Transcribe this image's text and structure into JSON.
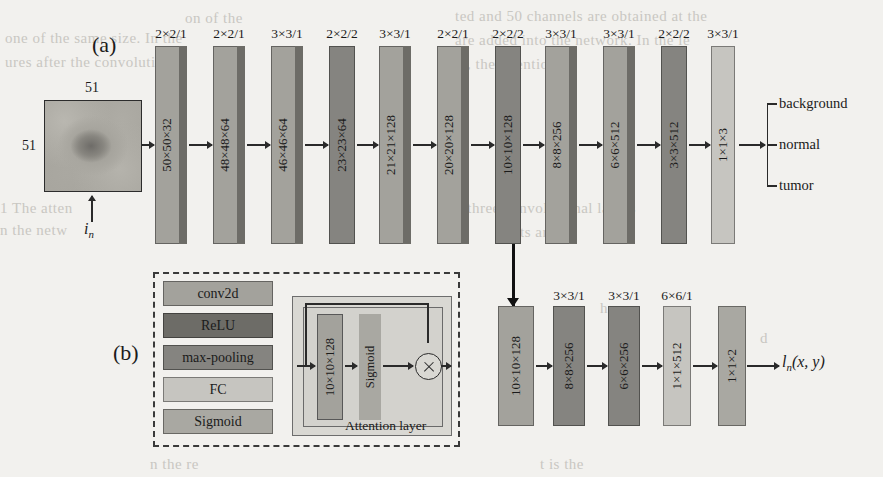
{
  "figure": {
    "panel_a_letter": "(a)",
    "panel_b_letter": "(b)",
    "input": {
      "width_label": "51",
      "height_label": "51",
      "input_symbol": "i",
      "input_symbol_sub": "n"
    },
    "output_formula_main": "l",
    "output_formula_sub": "n",
    "output_formula_tail": "(x, y)"
  },
  "colors": {
    "conv2d": "#a3a29c",
    "relu": "#6d6c67",
    "max_pooling": "#858480",
    "fc": "#c6c5c0",
    "sigmoid": "#a9a8a2",
    "page_background": "#f2f1ee",
    "line": "#2a2a2a",
    "attention_panel": "#d9d8d3"
  },
  "top_branch": {
    "layers": [
      {
        "name": "conv1",
        "kernel": "2×2/1",
        "shape": "50×50×32",
        "type": "conv2d",
        "x": 155,
        "w": 32,
        "edge": 8
      },
      {
        "name": "conv2",
        "kernel": "2×2/1",
        "shape": "48×48×64",
        "type": "conv2d",
        "x": 213,
        "w": 32,
        "edge": 8
      },
      {
        "name": "conv3",
        "kernel": "3×3/1",
        "shape": "46×46×64",
        "type": "conv2d",
        "x": 271,
        "w": 32,
        "edge": 8
      },
      {
        "name": "pool1",
        "kernel": "2×2/2",
        "shape": "23×23×64",
        "type": "max-pooling",
        "x": 329,
        "w": 26,
        "edge": 0
      },
      {
        "name": "conv4",
        "kernel": "3×3/1",
        "shape": "21×21×128",
        "type": "conv2d",
        "x": 379,
        "w": 32,
        "edge": 8
      },
      {
        "name": "conv5",
        "kernel": "2×2/1",
        "shape": "20×20×128",
        "type": "conv2d",
        "x": 437,
        "w": 32,
        "edge": 8
      },
      {
        "name": "pool2",
        "kernel": "2×2/2",
        "shape": "10×10×128",
        "type": "max-pooling",
        "x": 495,
        "w": 26,
        "edge": 0
      },
      {
        "name": "conv6",
        "kernel": "3×3/1",
        "shape": "8×8×256",
        "type": "conv2d",
        "x": 545,
        "w": 32,
        "edge": 8
      },
      {
        "name": "conv7",
        "kernel": "3×3/1",
        "shape": "6×6×512",
        "type": "conv2d",
        "x": 603,
        "w": 32,
        "edge": 8
      },
      {
        "name": "pool3",
        "kernel": "2×2/2",
        "shape": "3×3×512",
        "type": "max-pooling",
        "x": 661,
        "w": 26,
        "edge": 0
      },
      {
        "name": "fc1",
        "kernel": "3×3/1",
        "shape": "1×1×3",
        "type": "fc",
        "x": 711,
        "w": 24,
        "edge": 0
      }
    ],
    "classes": [
      "background",
      "normal",
      "tumor"
    ]
  },
  "bottom_branch": {
    "layers": [
      {
        "name": "feat",
        "kernel": "",
        "shape": "10×10×128",
        "type": "conv2d",
        "x": 498,
        "w": 36,
        "edge": 0
      },
      {
        "name": "conv8",
        "kernel": "3×3/1",
        "shape": "8×8×256",
        "type": "max-pooling",
        "x": 553,
        "w": 32,
        "edge": 0
      },
      {
        "name": "conv9",
        "kernel": "3×3/1",
        "shape": "6×6×256",
        "type": "max-pooling",
        "x": 608,
        "w": 32,
        "edge": 0
      },
      {
        "name": "fc2",
        "kernel": "6×6/1",
        "shape": "1×1×512",
        "type": "fc",
        "x": 663,
        "w": 28,
        "edge": 0
      },
      {
        "name": "fc3",
        "kernel": "",
        "shape": "1×1×2",
        "type": "sigmoid",
        "x": 718,
        "w": 28,
        "edge": 0
      }
    ]
  },
  "legend": {
    "items": [
      {
        "label": "conv2d",
        "type": "conv2d"
      },
      {
        "label": "ReLU",
        "type": "relu"
      },
      {
        "label": "max-pooling",
        "type": "max-pooling"
      },
      {
        "label": "FC",
        "type": "fc"
      },
      {
        "label": "Sigmoid",
        "type": "sigmoid"
      }
    ]
  },
  "attention": {
    "caption": "Attention layer",
    "conv_label": "10×10×128",
    "sigmoid_label": "Sigmoid",
    "multiply_symbol": "⊗"
  },
  "ghost_text": [
    {
      "t": "ted and 50 channels are obtained at the",
      "x": 455,
      "y": 8
    },
    {
      "t": "on of the",
      "x": 185,
      "y": 10
    },
    {
      "t": "are added into the network. In the le",
      "x": 455,
      "y": 32
    },
    {
      "t": "one of the same size. In the",
      "x": 5,
      "y": 30
    },
    {
      "t": "ures after the convolution",
      "x": 5,
      "y": 54
    },
    {
      "t": "er, the attention",
      "x": 455,
      "y": 56
    },
    {
      "t": "1 The atten",
      "x": 0,
      "y": 200
    },
    {
      "t": "d three convolutional layers",
      "x": 455,
      "y": 200
    },
    {
      "t": "n the netw",
      "x": 0,
      "y": 222
    },
    {
      "t": "ts are",
      "x": 520,
      "y": 224
    },
    {
      "t": "he",
      "x": 600,
      "y": 300
    },
    {
      "t": "d",
      "x": 760,
      "y": 330
    },
    {
      "t": "t is the",
      "x": 540,
      "y": 456
    },
    {
      "t": "n the re",
      "x": 150,
      "y": 456
    }
  ]
}
